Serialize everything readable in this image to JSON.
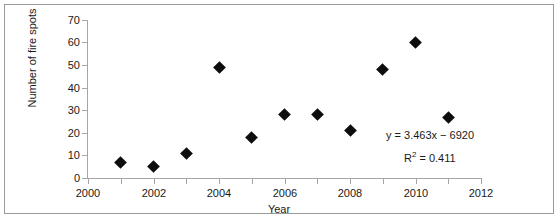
{
  "chart_data": {
    "type": "scatter",
    "title": "",
    "xlabel": "Year",
    "ylabel": "Number of fire spots",
    "xlim": [
      2000,
      2012
    ],
    "ylim": [
      0,
      70
    ],
    "xticks": [
      2000,
      2002,
      2004,
      2006,
      2008,
      2010,
      2012
    ],
    "xticks_minor": [
      2001,
      2003,
      2005,
      2007,
      2009,
      2011
    ],
    "yticks": [
      0,
      10,
      20,
      30,
      40,
      50,
      60,
      70
    ],
    "grid": false,
    "legend": false,
    "marker": "diamond",
    "marker_color": "#0d0d0d",
    "x": [
      2001,
      2002,
      2003,
      2004,
      2005,
      2006,
      2007,
      2008,
      2009,
      2010,
      2011
    ],
    "values": [
      7,
      5,
      11,
      49,
      18,
      28,
      28,
      21,
      48,
      60,
      27
    ],
    "points": [
      {
        "x": 2001,
        "y": 7
      },
      {
        "x": 2002,
        "y": 5
      },
      {
        "x": 2003,
        "y": 11
      },
      {
        "x": 2004,
        "y": 49
      },
      {
        "x": 2005,
        "y": 18
      },
      {
        "x": 2006,
        "y": 28
      },
      {
        "x": 2007,
        "y": 28
      },
      {
        "x": 2008,
        "y": 21
      },
      {
        "x": 2009,
        "y": 48
      },
      {
        "x": 2010,
        "y": 60
      },
      {
        "x": 2011,
        "y": 27
      }
    ],
    "annotations": {
      "equation": "y = 3.463x − 6920",
      "r_squared_label": "R",
      "r_squared_exponent": "2",
      "r_squared_value": " = 0.411",
      "r_squared_full": "R² = 0.411"
    },
    "trendline": {
      "slope": 3.463,
      "intercept": -6920,
      "r_squared": 0.411,
      "visible": false
    }
  },
  "axis_labels": {
    "y": [
      "70",
      "60",
      "50",
      "40",
      "30",
      "20",
      "10",
      "0"
    ],
    "x": [
      "2000",
      "2002",
      "2004",
      "2006",
      "2008",
      "2010",
      "2012"
    ]
  },
  "titles": {
    "y_axis": "Number of fire spots",
    "x_axis": "Year"
  }
}
